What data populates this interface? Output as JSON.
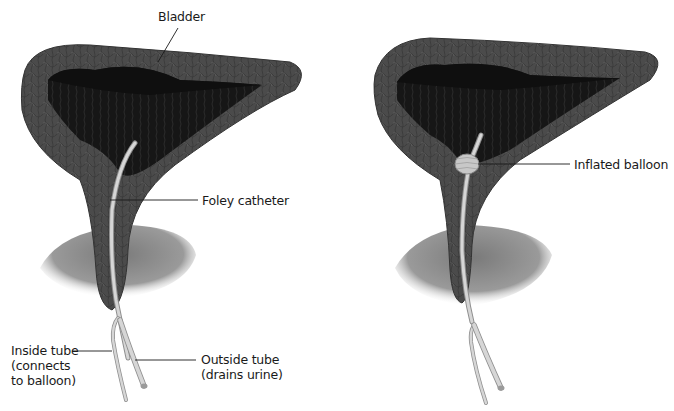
{
  "figure": {
    "left_panel": {
      "labels": {
        "bladder": "Bladder",
        "foley_catheter": "Foley catheter",
        "inside_tube": "Inside tube\n(connects\nto balloon)",
        "outside_tube": "Outside tube\n(drains urine)"
      }
    },
    "right_panel": {
      "labels": {
        "inflated_balloon": "Inflated balloon"
      }
    },
    "colors": {
      "bladder_wall": "#4a4a4a",
      "bladder_wall_light": "#6a6a6a",
      "bladder_interior": "#141414",
      "pelvic_floor": "#8a8a8a",
      "catheter": "#d4d4d4",
      "catheter_edge": "#8f8f8f",
      "leader_line": "#1a1a1a"
    }
  }
}
